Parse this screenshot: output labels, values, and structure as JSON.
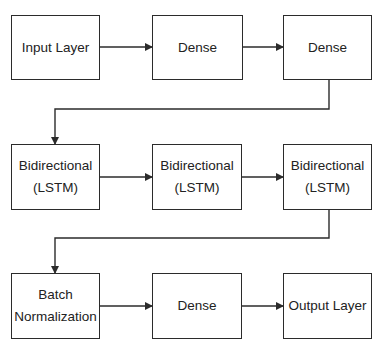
{
  "diagram": {
    "type": "flowchart",
    "direction": "left-to-right, wrapping rows",
    "colors": {
      "stroke": "#2b2b2b",
      "text": "#222222",
      "background": "#ffffff"
    },
    "nodes": [
      {
        "id": "n1",
        "lines": [
          "Input Layer"
        ]
      },
      {
        "id": "n2",
        "lines": [
          "Dense"
        ]
      },
      {
        "id": "n3",
        "lines": [
          "Dense"
        ]
      },
      {
        "id": "n4",
        "lines": [
          "Bidirectional",
          "(LSTM)"
        ]
      },
      {
        "id": "n5",
        "lines": [
          "Bidirectional",
          "(LSTM)"
        ]
      },
      {
        "id": "n6",
        "lines": [
          "Bidirectional",
          "(LSTM)"
        ]
      },
      {
        "id": "n7",
        "lines": [
          "Batch",
          "Normalization"
        ]
      },
      {
        "id": "n8",
        "lines": [
          "Dense"
        ]
      },
      {
        "id": "n9",
        "lines": [
          "Output Layer"
        ]
      }
    ],
    "edges": [
      {
        "from": "n1",
        "to": "n2"
      },
      {
        "from": "n2",
        "to": "n3"
      },
      {
        "from": "n3",
        "to": "n4"
      },
      {
        "from": "n4",
        "to": "n5"
      },
      {
        "from": "n5",
        "to": "n6"
      },
      {
        "from": "n6",
        "to": "n7"
      },
      {
        "from": "n7",
        "to": "n8"
      },
      {
        "from": "n8",
        "to": "n9"
      }
    ]
  }
}
